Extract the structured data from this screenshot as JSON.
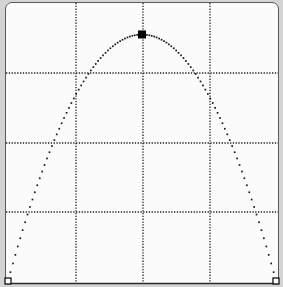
{
  "chart_data": {
    "type": "line",
    "title": "",
    "xlabel": "",
    "ylabel": "",
    "grid": true,
    "grid_style": "dotted",
    "grid_divisions": {
      "x": 4,
      "y": 4
    },
    "curve": "parabola (downward opening)",
    "x": [
      0,
      0.25,
      0.5,
      0.75,
      1.0
    ],
    "y": [
      0,
      0.75,
      0.89,
      0.75,
      0
    ],
    "peak": {
      "x": 0.5,
      "y": 0.89,
      "marker": "filled-square"
    },
    "endpoints": [
      {
        "x": 0,
        "y": 0,
        "marker": "hollow-square"
      },
      {
        "x": 1,
        "y": 0,
        "marker": "hollow-square"
      }
    ],
    "xlim": [
      0,
      1
    ],
    "ylim": [
      0,
      1
    ],
    "colors": {
      "curve": "#1a1a1a",
      "grid": "#222222",
      "background": "#fbfbfb",
      "frame": "#5a5a5a"
    }
  }
}
